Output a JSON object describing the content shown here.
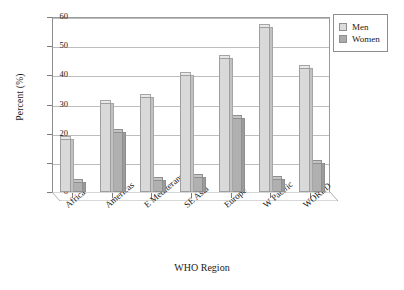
{
  "chart_data": {
    "type": "bar",
    "title": "",
    "xlabel": "WHO Region",
    "ylabel": "Percent (%)",
    "ylim": [
      0,
      60
    ],
    "yticks": [
      0,
      10,
      20,
      30,
      40,
      50,
      60
    ],
    "ytick_labels": [
      "0",
      "10",
      "20",
      "30",
      "40",
      "50",
      "60"
    ],
    "grid": true,
    "legend_position": "upper right",
    "categories": [
      "Africa",
      "Americas",
      "E Mediteranrean",
      "SE Asia",
      "Europe",
      "W Pacific",
      "WORLD"
    ],
    "series": [
      {
        "name": "Men",
        "color": "#d9d9d9",
        "values": [
          18.2,
          30.5,
          32.5,
          40.2,
          45.8,
          56.5,
          42.5
        ]
      },
      {
        "name": "Women",
        "color": "#b0b0b0",
        "values": [
          3.5,
          20.5,
          4.2,
          5.0,
          25.5,
          4.5,
          10.0
        ]
      }
    ]
  },
  "legend": {
    "items": [
      {
        "label": "Men",
        "swatch": "men"
      },
      {
        "label": "Women",
        "swatch": "women"
      }
    ]
  },
  "axes": {
    "y_title": "Percent (%)",
    "x_title": "WHO Region"
  }
}
